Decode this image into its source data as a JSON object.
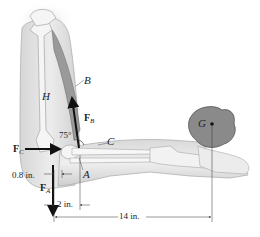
{
  "figure": {
    "type": "free-body diagram of human arm holding object",
    "labels": {
      "humerus": "H",
      "biceps": "B",
      "forearm": "C",
      "joint_point": "A",
      "object_center": "G",
      "angle": "75°"
    },
    "forces": {
      "FB": {
        "main": "F",
        "sub": "B"
      },
      "FC": {
        "main": "F",
        "sub": "C"
      },
      "FA": {
        "main": "F",
        "sub": "A"
      }
    },
    "dimensions": {
      "d1": "0.8 in.",
      "d2": "2 in.",
      "d3": "14 in."
    },
    "colors": {
      "skin_light": "#e8e8e8",
      "skin_mid": "#c9c9c9",
      "muscle": "#9a9a9a",
      "bone": "#f4f4f4",
      "object": "#8a8a8a",
      "arrow": "#111111",
      "line": "#333333"
    }
  }
}
